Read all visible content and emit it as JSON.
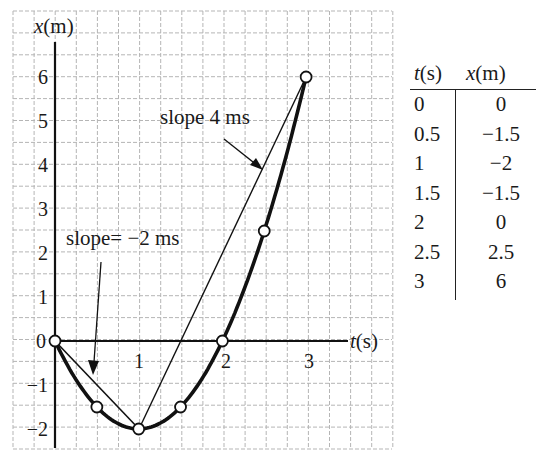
{
  "chart_data": {
    "type": "line",
    "title": "",
    "xlabel": "t(s)",
    "ylabel": "x(m)",
    "xlim": [
      -0.5,
      3.9
    ],
    "ylim": [
      -2.5,
      7.5
    ],
    "grid": true,
    "x_ticks": [
      "1",
      "2",
      "3"
    ],
    "y_ticks": [
      "6",
      "5",
      "4",
      "3",
      "2",
      "1",
      "0",
      "-1",
      "-2"
    ],
    "series": [
      {
        "name": "x(t) = 2t^2 - 4t",
        "style": "thick curve with open circle markers",
        "x": [
          0,
          0.5,
          1,
          1.5,
          2,
          2.5,
          3
        ],
        "y": [
          0,
          -1.5,
          -2,
          -1.5,
          0,
          2.5,
          6
        ]
      },
      {
        "name": "chord slope -2",
        "style": "thin line",
        "x": [
          0,
          1
        ],
        "y": [
          0,
          -2
        ]
      },
      {
        "name": "chord slope 4",
        "style": "thin line",
        "x": [
          1,
          3
        ],
        "y": [
          -2,
          6
        ]
      }
    ],
    "annotations": [
      {
        "text": "slope 4 ms",
        "points_to": "chord from t=1 to t=3"
      },
      {
        "text": "slope= −2 ms",
        "points_to": "chord from t=0 to t=1"
      }
    ]
  },
  "axes": {
    "x_label_var": "t",
    "x_label_unit": "(s)",
    "y_label_var": "x",
    "y_label_unit": "(m)",
    "x_ticks": [
      "1",
      "2",
      "3"
    ],
    "y_ticks": [
      "6",
      "5",
      "4",
      "3",
      "2",
      "1",
      "0",
      "−1",
      "−2"
    ]
  },
  "annotations": {
    "slope_pos": "slope 4 ms",
    "slope_neg": "slope= −2 ms"
  },
  "table": {
    "headers": {
      "t_var": "t",
      "t_unit": "(s)",
      "x_var": "x",
      "x_unit": "(m)"
    },
    "rows": [
      {
        "t": "0",
        "x": "0"
      },
      {
        "t": "0.5",
        "x": "−1.5"
      },
      {
        "t": "1",
        "x": "−2"
      },
      {
        "t": "1.5",
        "x": "−1.5"
      },
      {
        "t": "2",
        "x": "0"
      },
      {
        "t": "2.5",
        "x": "2.5"
      },
      {
        "t": "3",
        "x": "6"
      }
    ]
  }
}
